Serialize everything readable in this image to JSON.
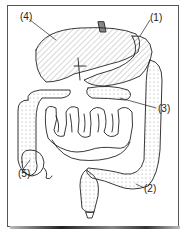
{
  "diagram": {
    "labels": [
      {
        "id": "4",
        "text": "(4)",
        "points_to": "liver"
      },
      {
        "id": "1",
        "text": "(1)",
        "points_to": "stomach"
      },
      {
        "id": "3",
        "text": "(3)",
        "points_to": "pancreas"
      },
      {
        "id": "5",
        "text": "(5)",
        "points_to": "appendix"
      },
      {
        "id": "2",
        "text": "(2)",
        "points_to": "large intestine"
      }
    ],
    "colors": {
      "line": "#222222",
      "background": "#ffffff",
      "frame": "#555555"
    }
  }
}
